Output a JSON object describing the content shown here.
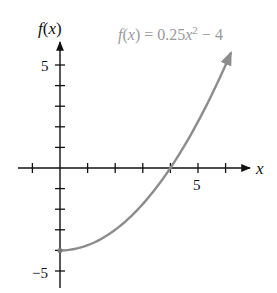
{
  "chart_data": {
    "type": "line",
    "title": "",
    "function_label": "f(x) = 0.25x² − 4",
    "function_label_parts": {
      "lhs": "f(x) = 0.25x",
      "exp": "2",
      "rest": " − 4"
    },
    "xlabel": "x",
    "ylabel": "f(x)",
    "x_tick_labels": [
      "5"
    ],
    "y_tick_labels": [
      "5",
      "−5"
    ],
    "x_ticks": [
      -1,
      1,
      2,
      3,
      4,
      5,
      6
    ],
    "y_ticks": [
      -5,
      -4,
      -3,
      -2,
      -1,
      1,
      2,
      3,
      4,
      5
    ],
    "xlim": [
      -2,
      7
    ],
    "ylim": [
      -5.7,
      6
    ],
    "grid": false,
    "series": [
      {
        "name": "f(x) = 0.25x^2 - 4",
        "domain": [
          0,
          6.2
        ],
        "x": [
          0,
          1,
          2,
          3,
          4,
          5,
          6,
          6.2
        ],
        "y": [
          -4,
          -3.75,
          -3,
          -1.75,
          0,
          2.25,
          5,
          5.61
        ],
        "start_point": [
          0,
          -4
        ],
        "end_arrow": true,
        "color": "#8c8c8c"
      }
    ],
    "axis_color": "#111111",
    "label_color": "#9a9a9a"
  }
}
